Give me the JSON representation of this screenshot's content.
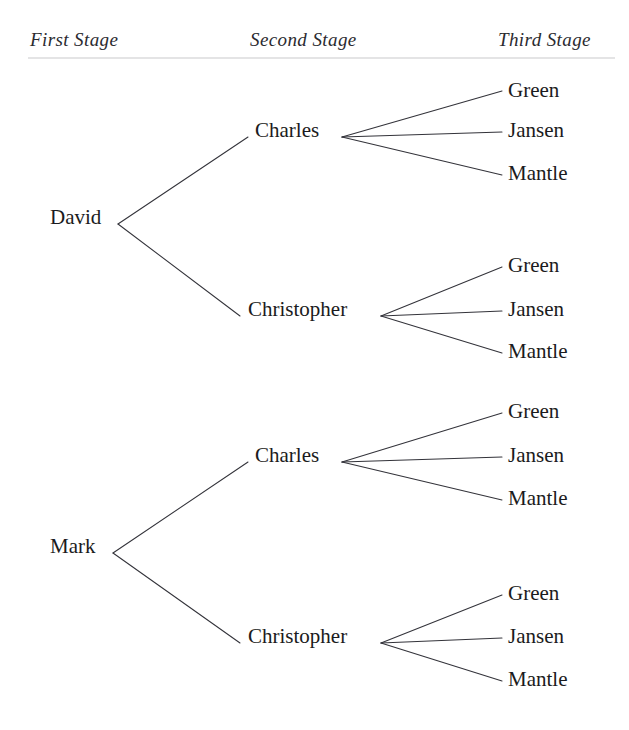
{
  "figure": {
    "type": "tree-diagram",
    "background_color": "#ffffff",
    "text_color": "#1b1b20",
    "line_color": "#33333a",
    "rule_color": "#c9c9cc"
  },
  "headers": [
    {
      "label": "First Stage",
      "x": 30,
      "y": 46
    },
    {
      "label": "Second Stage",
      "x": 250,
      "y": 46
    },
    {
      "label": "Third Stage",
      "x": 498,
      "y": 46
    }
  ],
  "rule": {
    "x1": 28,
    "x2": 615,
    "y": 58
  },
  "nodes": {
    "first_stage": [
      {
        "label": "David",
        "x": 50,
        "y": 224,
        "vertex_x": 118,
        "vertex_y": 224
      },
      {
        "label": "Mark",
        "x": 50,
        "y": 553,
        "vertex_x": 113,
        "vertex_y": 553
      }
    ],
    "second_stage": [
      {
        "label": "Charles",
        "x": 255,
        "y": 137,
        "vertex_x": 342,
        "vertex_y": 137,
        "entry_x": 248,
        "parent": "David"
      },
      {
        "label": "Christopher",
        "x": 248,
        "y": 316,
        "vertex_x": 381,
        "vertex_y": 316,
        "entry_x": 240,
        "parent": "David"
      },
      {
        "label": "Charles",
        "x": 255,
        "y": 462,
        "vertex_x": 342,
        "vertex_y": 462,
        "entry_x": 248,
        "parent": "Mark"
      },
      {
        "label": "Christopher",
        "x": 248,
        "y": 643,
        "vertex_x": 381,
        "vertex_y": 643,
        "entry_x": 240,
        "parent": "Mark"
      }
    ],
    "third_stage": [
      {
        "label": "Green",
        "x": 508,
        "y": 97,
        "line_end_x": 502,
        "parent": "Charles",
        "group": "David"
      },
      {
        "label": "Jansen",
        "x": 508,
        "y": 137,
        "line_end_x": 502,
        "parent": "Charles",
        "group": "David"
      },
      {
        "label": "Mantle",
        "x": 508,
        "y": 180,
        "line_end_x": 502,
        "parent": "Charles",
        "group": "David"
      },
      {
        "label": "Green",
        "x": 508,
        "y": 272,
        "line_end_x": 502,
        "parent": "Christopher",
        "group": "David"
      },
      {
        "label": "Jansen",
        "x": 508,
        "y": 316,
        "line_end_x": 502,
        "parent": "Christopher",
        "group": "David"
      },
      {
        "label": "Mantle",
        "x": 508,
        "y": 358,
        "line_end_x": 502,
        "parent": "Christopher",
        "group": "David"
      },
      {
        "label": "Green",
        "x": 508,
        "y": 418,
        "line_end_x": 502,
        "parent": "Charles",
        "group": "Mark"
      },
      {
        "label": "Jansen",
        "x": 508,
        "y": 462,
        "line_end_x": 502,
        "parent": "Charles",
        "group": "Mark"
      },
      {
        "label": "Mantle",
        "x": 508,
        "y": 505,
        "line_end_x": 502,
        "parent": "Charles",
        "group": "Mark"
      },
      {
        "label": "Green",
        "x": 508,
        "y": 600,
        "line_end_x": 502,
        "parent": "Christopher",
        "group": "Mark"
      },
      {
        "label": "Jansen",
        "x": 508,
        "y": 643,
        "line_end_x": 502,
        "parent": "Christopher",
        "group": "Mark"
      },
      {
        "label": "Mantle",
        "x": 508,
        "y": 686,
        "line_end_x": 502,
        "parent": "Christopher",
        "group": "Mark"
      }
    ]
  },
  "edges": [
    {
      "from": "David",
      "to": "Charles",
      "x1": 118,
      "y1": 224,
      "x2": 248,
      "y2": 137
    },
    {
      "from": "David",
      "to": "Christopher",
      "x1": 118,
      "y1": 224,
      "x2": 240,
      "y2": 316
    },
    {
      "from": "Mark",
      "to": "Charles",
      "x1": 113,
      "y1": 553,
      "x2": 248,
      "y2": 462
    },
    {
      "from": "Mark",
      "to": "Christopher",
      "x1": 113,
      "y1": 553,
      "x2": 240,
      "y2": 643
    },
    {
      "from": "Charles-1",
      "to": "Green-1",
      "x1": 342,
      "y1": 137,
      "x2": 502,
      "y2": 91
    },
    {
      "from": "Charles-1",
      "to": "Jansen-1",
      "x1": 342,
      "y1": 137,
      "x2": 502,
      "y2": 132
    },
    {
      "from": "Charles-1",
      "to": "Mantle-1",
      "x1": 342,
      "y1": 137,
      "x2": 502,
      "y2": 175
    },
    {
      "from": "Christopher-1",
      "to": "Green-2",
      "x1": 381,
      "y1": 316,
      "x2": 502,
      "y2": 267
    },
    {
      "from": "Christopher-1",
      "to": "Jansen-2",
      "x1": 381,
      "y1": 316,
      "x2": 502,
      "y2": 311
    },
    {
      "from": "Christopher-1",
      "to": "Mantle-2",
      "x1": 381,
      "y1": 316,
      "x2": 502,
      "y2": 353
    },
    {
      "from": "Charles-2",
      "to": "Green-3",
      "x1": 342,
      "y1": 462,
      "x2": 502,
      "y2": 413
    },
    {
      "from": "Charles-2",
      "to": "Jansen-3",
      "x1": 342,
      "y1": 462,
      "x2": 502,
      "y2": 457
    },
    {
      "from": "Charles-2",
      "to": "Mantle-3",
      "x1": 342,
      "y1": 462,
      "x2": 502,
      "y2": 500
    },
    {
      "from": "Christopher-2",
      "to": "Green-4",
      "x1": 381,
      "y1": 643,
      "x2": 502,
      "y2": 595
    },
    {
      "from": "Christopher-2",
      "to": "Jansen-4",
      "x1": 381,
      "y1": 643,
      "x2": 502,
      "y2": 638
    },
    {
      "from": "Christopher-2",
      "to": "Mantle-4",
      "x1": 381,
      "y1": 643,
      "x2": 502,
      "y2": 681
    }
  ]
}
